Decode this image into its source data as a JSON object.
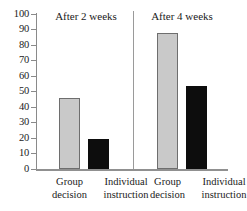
{
  "chart_data": {
    "type": "bar",
    "title": "",
    "subtitle": "",
    "xlabel": "",
    "ylabel": "",
    "ylim": [
      0,
      100
    ],
    "y_ticks": [
      0,
      10,
      20,
      30,
      40,
      50,
      60,
      70,
      80,
      90,
      100
    ],
    "y_tick_labels": [
      "0",
      "10",
      "20",
      "30",
      "40",
      "50",
      "60",
      "70",
      "80",
      "90",
      "100"
    ],
    "grid": false,
    "legend": "none",
    "panels": [
      {
        "title": "After 2 weeks",
        "categories": [
          "Group decision",
          "Individual instruction"
        ],
        "values": [
          46,
          19.5
        ],
        "bar_colors": [
          "#c9c9c9",
          "#0d0d0d"
        ]
      },
      {
        "title": "After 4 weeks",
        "categories": [
          "Group decision",
          "Individual instruction"
        ],
        "values": [
          88,
          53.5
        ],
        "bar_colors": [
          "#c9c9c9",
          "#0d0d0d"
        ]
      }
    ],
    "categories": [
      "Group decision",
      "Individual instruction"
    ],
    "series": [
      {
        "name": "After 2 weeks",
        "values": [
          46,
          19.5
        ]
      },
      {
        "name": "After 4 weeks",
        "values": [
          88,
          53.5
        ]
      }
    ],
    "colors": {
      "light_bar": "#c9c9c9",
      "dark_bar": "#0d0d0d",
      "axis": "#8a8a8a",
      "text": "#1a1a1a",
      "background": "#ffffff"
    }
  },
  "axis": {
    "ticks": [
      {
        "label": "100"
      },
      {
        "label": "90"
      },
      {
        "label": "80"
      },
      {
        "label": "70"
      },
      {
        "label": "60"
      },
      {
        "label": "50"
      },
      {
        "label": "40"
      },
      {
        "label": "30"
      },
      {
        "label": "20"
      },
      {
        "label": "10"
      },
      {
        "label": "0"
      }
    ]
  },
  "panels": [
    {
      "title": "After 2 weeks",
      "bars": [
        {
          "label_line1": "Group",
          "label_line2": "decision",
          "value": 46
        },
        {
          "label_line1": "Individual",
          "label_line2": "instruction",
          "value": 19.5
        }
      ]
    },
    {
      "title": "After 4 weeks",
      "bars": [
        {
          "label_line1": "Group",
          "label_line2": "decision",
          "value": 88
        },
        {
          "label_line1": "Individual",
          "label_line2": "instruction",
          "value": 53.5
        }
      ]
    }
  ]
}
